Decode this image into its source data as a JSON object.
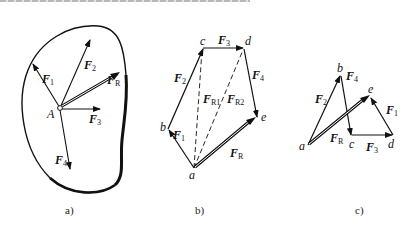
{
  "figure": {
    "panels": [
      {
        "id": "a",
        "caption": "a)",
        "point_label": "A",
        "forces": [
          {
            "name": "F",
            "sub": "1"
          },
          {
            "name": "F",
            "sub": "2"
          },
          {
            "name": "F",
            "sub": "3"
          },
          {
            "name": "F",
            "sub": "4"
          },
          {
            "name": "F",
            "sub": "R"
          }
        ]
      },
      {
        "id": "b",
        "caption": "b)",
        "points": [
          "a",
          "b",
          "c",
          "d",
          "e"
        ],
        "forces": [
          {
            "name": "F",
            "sub": "1"
          },
          {
            "name": "F",
            "sub": "2"
          },
          {
            "name": "F",
            "sub": "3"
          },
          {
            "name": "F",
            "sub": "4"
          },
          {
            "name": "F",
            "sub": "R"
          },
          {
            "name": "F",
            "sub": "R1"
          },
          {
            "name": "F",
            "sub": "R2"
          }
        ]
      },
      {
        "id": "c",
        "caption": "c)",
        "points": [
          "a",
          "b",
          "c",
          "d",
          "e"
        ],
        "forces": [
          {
            "name": "F",
            "sub": "2"
          },
          {
            "name": "F",
            "sub": "4"
          },
          {
            "name": "F",
            "sub": "3"
          },
          {
            "name": "F",
            "sub": "1"
          },
          {
            "name": "F",
            "sub": "R"
          }
        ]
      }
    ]
  }
}
